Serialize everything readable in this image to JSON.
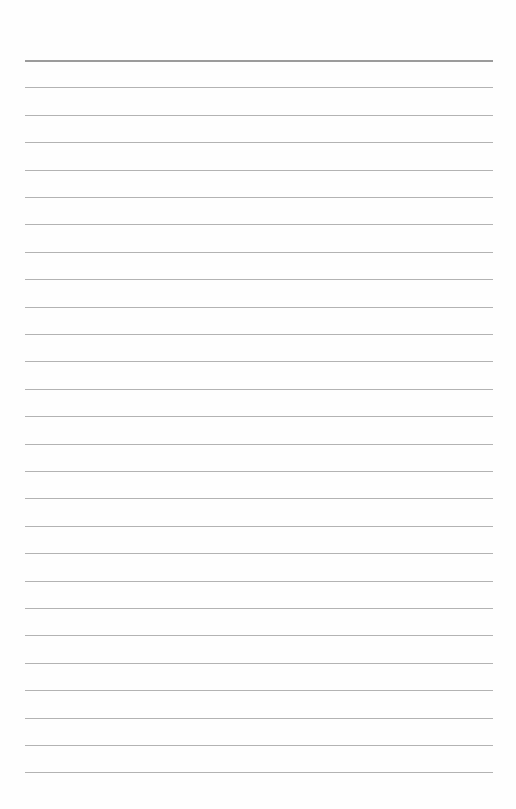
{
  "page": {
    "type": "lined-paper",
    "background": "#fefefe",
    "rule_color": "#9a9a9a",
    "top_rule_color": "#8a8a8a",
    "rule_left": 25,
    "rule_width": 468,
    "first_rule_y": 60,
    "rule_spacing": 27.4,
    "rule_count": 27
  }
}
